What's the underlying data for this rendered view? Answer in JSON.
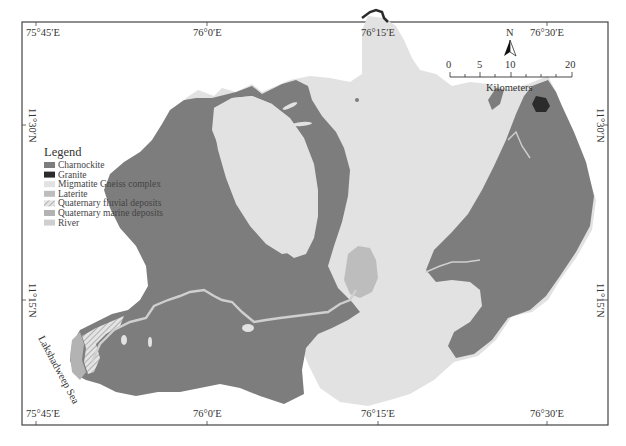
{
  "map": {
    "legend": {
      "title": "Legend",
      "items": [
        {
          "label": "Charnockite",
          "color": "#7d7d7d",
          "pattern": "solid"
        },
        {
          "label": "Granite",
          "color": "#2b2b2b",
          "pattern": "solid"
        },
        {
          "label": "Migmatite Gneiss complex",
          "color": "#e2e2e2",
          "pattern": "solid"
        },
        {
          "label": "Laterite",
          "color": "#bdbdbd",
          "pattern": "solid"
        },
        {
          "label": "Quaternary fluvial deposits",
          "color": "#d6d6d6",
          "pattern": "hatched"
        },
        {
          "label": "Quaternary marine deposits",
          "color": "#b3b3b3",
          "pattern": "solid"
        },
        {
          "label": "River",
          "color": "#cfcfcf",
          "pattern": "solid"
        }
      ]
    },
    "longitude_labels": [
      "75°45′E",
      "76°0′E",
      "76°15′E",
      "76°30′E"
    ],
    "latitude_labels": [
      "11°30′N",
      "11°15′N"
    ],
    "north_arrow": {
      "label": "N"
    },
    "scale_bar": {
      "ticks": [
        "0",
        "5",
        "10",
        "20"
      ],
      "unit": "Kilometers"
    },
    "sea_label": "Lakshadweep Sea"
  }
}
